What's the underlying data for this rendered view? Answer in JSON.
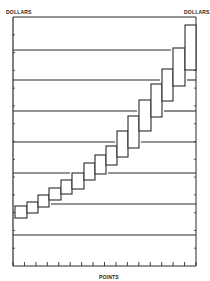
{
  "chart_data": {
    "type": "bar",
    "subtype": "floating-range-staircase",
    "title": "",
    "ylabel_left": "DOLLARS",
    "ylabel_right": "DOLLARS",
    "xlabel": "POINTS",
    "grid": "horizontal",
    "x_tick_count": 17,
    "y_tick_count": 15,
    "categories": [
      1,
      2,
      3,
      4,
      5,
      6,
      7,
      8,
      9,
      10,
      11,
      12,
      13,
      14,
      15,
      16
    ],
    "series": [
      {
        "name": "low",
        "values": [
          1.6,
          1.7,
          1.9,
          2.1,
          2.3,
          2.5,
          2.8,
          3.0,
          3.3,
          3.5,
          3.8,
          4.3,
          4.7,
          5.2,
          5.7,
          6.3
        ]
      },
      {
        "name": "high",
        "values": [
          2.0,
          2.1,
          2.3,
          2.5,
          2.8,
          3.0,
          3.3,
          3.6,
          3.9,
          4.4,
          4.8,
          5.4,
          5.9,
          6.4,
          7.1,
          7.8
        ]
      }
    ],
    "ylim": [
      0,
      8
    ],
    "gridline_values": [
      1,
      2,
      3,
      4,
      5,
      6,
      7
    ]
  },
  "labels": {
    "left_axis": "DOLLARS",
    "right_axis": "DOLLARS",
    "bottom_axis": "POINTS"
  },
  "geometry": {
    "frame": {
      "left": 13,
      "right": 196,
      "top": 17,
      "bottom": 266
    },
    "gridlines_y": [
      50,
      80,
      111,
      142,
      173,
      204,
      235
    ],
    "boxes": [
      {
        "x0": 15,
        "x1": 27,
        "top": 206,
        "bottom": 218
      },
      {
        "x0": 27,
        "x1": 38,
        "top": 202,
        "bottom": 213
      },
      {
        "x0": 38,
        "x1": 49,
        "top": 195,
        "bottom": 207
      },
      {
        "x0": 49,
        "x1": 61,
        "top": 188,
        "bottom": 200
      },
      {
        "x0": 61,
        "x1": 72,
        "top": 180,
        "bottom": 194
      },
      {
        "x0": 72,
        "x1": 84,
        "top": 173,
        "bottom": 189
      },
      {
        "x0": 84,
        "x1": 95,
        "top": 163,
        "bottom": 180
      },
      {
        "x0": 95,
        "x1": 106,
        "top": 155,
        "bottom": 174
      },
      {
        "x0": 106,
        "x1": 117,
        "top": 146,
        "bottom": 165
      },
      {
        "x0": 117,
        "x1": 128,
        "top": 131,
        "bottom": 157
      },
      {
        "x0": 128,
        "x1": 139,
        "top": 116,
        "bottom": 148
      },
      {
        "x0": 139,
        "x1": 151,
        "top": 100,
        "bottom": 131
      },
      {
        "x0": 151,
        "x1": 162,
        "top": 84,
        "bottom": 117
      },
      {
        "x0": 162,
        "x1": 173,
        "top": 69,
        "bottom": 101
      },
      {
        "x0": 173,
        "x1": 185,
        "top": 48,
        "bottom": 86
      },
      {
        "x0": 185,
        "x1": 196,
        "top": 25,
        "bottom": 70
      }
    ]
  },
  "colors": {
    "ink": "#2a2a2a",
    "paper": "#ffffff"
  }
}
